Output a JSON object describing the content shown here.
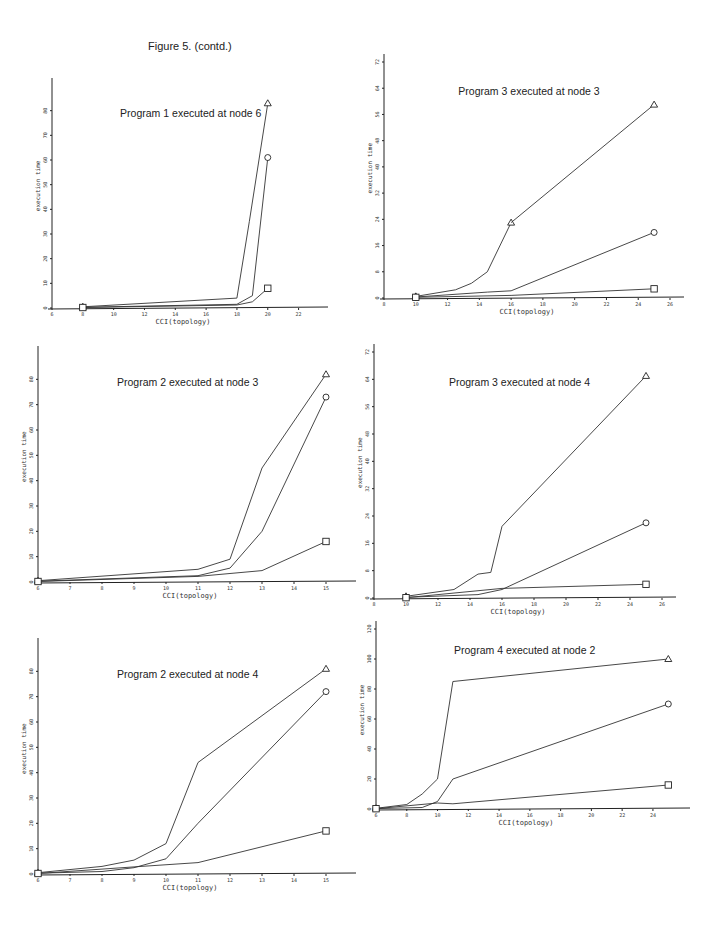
{
  "figure": {
    "title": "Figure 5.  (contd.)"
  },
  "legend_markers": {
    "triangle": "series-triangle",
    "circle": "series-circle",
    "square": "series-square"
  },
  "chart_data": [
    {
      "id": "p1n6",
      "type": "line",
      "title": "Program 1 executed at node 6",
      "xlabel": "CCI(topology)",
      "ylabel": "execution time",
      "xlim": [
        6,
        23
      ],
      "ylim": [
        0,
        90
      ],
      "xticks": [
        6,
        8,
        10,
        12,
        14,
        16,
        18,
        20,
        22
      ],
      "yticks": [
        0,
        10,
        20,
        30,
        40,
        50,
        60,
        70,
        80
      ],
      "grid": false,
      "series": [
        {
          "name": "triangle",
          "marker": "triangle",
          "x": [
            8,
            18,
            18.8,
            20
          ],
          "y": [
            0.5,
            4,
            35,
            83
          ]
        },
        {
          "name": "circle",
          "marker": "circle",
          "x": [
            8,
            18,
            19,
            20
          ],
          "y": [
            0.3,
            1.5,
            5,
            61
          ]
        },
        {
          "name": "square",
          "marker": "square",
          "x": [
            8,
            18,
            19,
            20
          ],
          "y": [
            0.2,
            1.2,
            2.5,
            8
          ]
        }
      ],
      "box": {
        "left": 20,
        "top": 56,
        "w": 300,
        "h": 266,
        "ox": 32,
        "oy": 252,
        "pw": 262,
        "ph": 222
      }
    },
    {
      "id": "p3n3",
      "type": "line",
      "title": "Program 3 executed at node 3",
      "xlabel": "CCI(topology)",
      "ylabel": "execution time",
      "xlim": [
        8,
        26
      ],
      "ylim": [
        0,
        72
      ],
      "xticks": [
        8,
        10,
        12,
        14,
        16,
        18,
        20,
        22,
        24,
        26
      ],
      "yticks": [
        0,
        8,
        16,
        24,
        32,
        40,
        48,
        56,
        64,
        72
      ],
      "grid": false,
      "series": [
        {
          "name": "triangle",
          "marker": "triangle",
          "x": [
            10,
            12.5,
            13.5,
            14.5,
            16
          ],
          "y": [
            0.5,
            2.5,
            4.5,
            8,
            23
          ]
        },
        {
          "name": "triangle-cont",
          "marker": "triangle",
          "x": [
            16,
            25
          ],
          "y": [
            23,
            59
          ]
        },
        {
          "name": "circle",
          "marker": "circle",
          "x": [
            10,
            14.5,
            16,
            25
          ],
          "y": [
            0.3,
            1.8,
            2.2,
            20
          ]
        },
        {
          "name": "square",
          "marker": "square",
          "x": [
            10,
            16,
            25
          ],
          "y": [
            0.2,
            0.8,
            2.8
          ]
        }
      ],
      "box": {
        "left": 370,
        "top": 50,
        "w": 320,
        "h": 280,
        "ox": 14,
        "oy": 248,
        "pw": 286,
        "ph": 236
      }
    },
    {
      "id": "p2n3",
      "type": "line",
      "title": "Program 2 executed at node 3",
      "xlabel": "CCI(topology)",
      "ylabel": "execution time",
      "xlim": [
        6,
        15.5
      ],
      "ylim": [
        0,
        90
      ],
      "xticks": [
        6,
        7,
        8,
        9,
        10,
        11,
        12,
        13,
        14,
        15
      ],
      "yticks": [
        0,
        10,
        20,
        30,
        40,
        50,
        60,
        70,
        80
      ],
      "grid": false,
      "series": [
        {
          "name": "triangle",
          "marker": "triangle",
          "x": [
            6,
            11,
            12,
            13,
            15
          ],
          "y": [
            0.5,
            5,
            9,
            45,
            82
          ]
        },
        {
          "name": "circle",
          "marker": "circle",
          "x": [
            6,
            11,
            12,
            13,
            15
          ],
          "y": [
            0.3,
            2.5,
            5.5,
            20,
            73
          ]
        },
        {
          "name": "square",
          "marker": "square",
          "x": [
            6,
            11,
            13,
            15
          ],
          "y": [
            0.2,
            2.2,
            4.5,
            16
          ]
        }
      ],
      "box": {
        "left": 20,
        "top": 330,
        "w": 340,
        "h": 280,
        "ox": 18,
        "oy": 252,
        "pw": 304,
        "ph": 228
      }
    },
    {
      "id": "p3n4",
      "type": "line",
      "title": "Program 3 executed at node 4",
      "xlabel": "CCI(topology)",
      "ylabel": "execution time",
      "xlim": [
        8,
        26
      ],
      "ylim": [
        0,
        72
      ],
      "xticks": [
        8,
        10,
        12,
        14,
        16,
        18,
        20,
        22,
        24,
        26
      ],
      "yticks": [
        0,
        8,
        16,
        24,
        32,
        40,
        48,
        56,
        64,
        72
      ],
      "grid": false,
      "series": [
        {
          "name": "triangle",
          "marker": "triangle",
          "x": [
            10,
            13,
            14.5,
            15.3,
            16,
            25
          ],
          "y": [
            0.5,
            2.5,
            7,
            7.5,
            21,
            65
          ]
        },
        {
          "name": "circle",
          "marker": "circle",
          "x": [
            10,
            14.5,
            16,
            25
          ],
          "y": [
            0.2,
            1,
            2.5,
            22
          ]
        },
        {
          "name": "square",
          "marker": "square",
          "x": [
            10,
            16,
            25
          ],
          "y": [
            0.1,
            2.8,
            4
          ]
        }
      ],
      "box": {
        "left": 360,
        "top": 340,
        "w": 330,
        "h": 270,
        "ox": 14,
        "oy": 258,
        "pw": 288,
        "ph": 246
      }
    },
    {
      "id": "p2n4",
      "type": "line",
      "title": "Program 2 executed at node 4",
      "xlabel": "CCI(topology)",
      "ylabel": "execution time",
      "xlim": [
        6,
        15.5
      ],
      "ylim": [
        0,
        90
      ],
      "xticks": [
        6,
        7,
        8,
        9,
        10,
        11,
        12,
        13,
        14,
        15
      ],
      "yticks": [
        0,
        10,
        20,
        30,
        40,
        50,
        60,
        70,
        80
      ],
      "grid": false,
      "series": [
        {
          "name": "triangle",
          "marker": "triangle",
          "x": [
            6,
            8,
            9,
            10,
            11,
            15
          ],
          "y": [
            0.5,
            3,
            5.5,
            12,
            44,
            81
          ]
        },
        {
          "name": "circle",
          "marker": "circle",
          "x": [
            6,
            8,
            9,
            10,
            11,
            15
          ],
          "y": [
            0.3,
            1,
            2.5,
            6,
            20,
            72
          ]
        },
        {
          "name": "square",
          "marker": "square",
          "x": [
            6,
            9,
            11,
            15
          ],
          "y": [
            0.2,
            2.8,
            4.5,
            17
          ]
        }
      ],
      "box": {
        "left": 20,
        "top": 620,
        "w": 340,
        "h": 270,
        "ox": 18,
        "oy": 254,
        "pw": 304,
        "ph": 228
      }
    },
    {
      "id": "p4n2",
      "type": "line",
      "title": "Program 4 executed at node 2",
      "xlabel": "CCI(topology)",
      "ylabel": "execution time",
      "xlim": [
        6,
        25.5
      ],
      "ylim": [
        0,
        120
      ],
      "xticks": [
        6,
        8,
        10,
        12,
        14,
        16,
        18,
        20,
        22,
        24
      ],
      "yticks": [
        0,
        20,
        40,
        60,
        80,
        100,
        120
      ],
      "grid": false,
      "series": [
        {
          "name": "triangle",
          "marker": "triangle",
          "x": [
            6,
            8,
            9,
            10,
            11,
            25
          ],
          "y": [
            0.5,
            3,
            10,
            20,
            85,
            100
          ]
        },
        {
          "name": "circle",
          "marker": "circle",
          "x": [
            6,
            9,
            10,
            11,
            25
          ],
          "y": [
            0.3,
            1,
            5,
            20,
            70
          ]
        },
        {
          "name": "square",
          "marker": "square",
          "x": [
            6,
            10,
            11,
            25
          ],
          "y": [
            0.2,
            4,
            3.5,
            16
          ]
        }
      ],
      "box": {
        "left": 360,
        "top": 620,
        "w": 330,
        "h": 230,
        "ox": 16,
        "oy": 189,
        "pw": 300,
        "ph": 180
      }
    }
  ]
}
